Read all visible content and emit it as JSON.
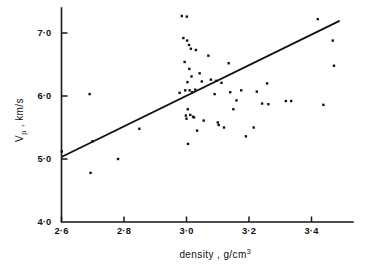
{
  "chart_data": {
    "type": "scatter",
    "title": "",
    "xlabel": "density , g/cm3",
    "ylabel": "Vp , km/s",
    "xlabel_main": "density ,  g/cm",
    "xlabel_exponent": "3",
    "ylabel_main": "V",
    "ylabel_sub": "p",
    "ylabel_rest": " ,  km/s",
    "xlim": [
      2.6,
      3.52
    ],
    "ylim": [
      4.0,
      7.35
    ],
    "grid": false,
    "legend": null,
    "xticks": [
      2.6,
      2.8,
      3.0,
      3.2,
      3.4
    ],
    "xtick_labels": [
      "2·6",
      "2·8",
      "3·0",
      "3·2",
      "3·4"
    ],
    "yticks": [
      4.0,
      5.0,
      6.0,
      7.0
    ],
    "ytick_labels": [
      "4·0",
      "5·0",
      "6·0",
      "7·0"
    ],
    "marker": "square",
    "marker_size_px": 2.4,
    "marker_color": "#111111",
    "line_color": "#121212",
    "axis_color": "#161616",
    "fit_line": {
      "name": "regression line",
      "x": [
        2.603,
        3.488
      ],
      "y": [
        5.04,
        7.19
      ]
    },
    "series": [
      {
        "name": "Vp vs density",
        "points": [
          [
            2.601,
            5.12
          ],
          [
            2.69,
            6.03
          ],
          [
            2.693,
            4.78
          ],
          [
            2.699,
            5.28
          ],
          [
            2.781,
            5.0
          ],
          [
            2.849,
            5.48
          ],
          [
            2.978,
            6.05
          ],
          [
            2.985,
            7.27
          ],
          [
            2.99,
            6.92
          ],
          [
            2.994,
            6.54
          ],
          [
            2.996,
            6.09
          ],
          [
            2.998,
            5.69
          ],
          [
            3.0,
            5.64
          ],
          [
            3.001,
            7.26
          ],
          [
            3.002,
            6.88
          ],
          [
            3.003,
            6.22
          ],
          [
            3.004,
            5.79
          ],
          [
            3.005,
            5.24
          ],
          [
            3.008,
            6.81
          ],
          [
            3.009,
            6.43
          ],
          [
            3.01,
            6.09
          ],
          [
            3.012,
            5.7
          ],
          [
            3.014,
            6.75
          ],
          [
            3.016,
            6.31
          ],
          [
            3.018,
            6.06
          ],
          [
            3.021,
            5.67
          ],
          [
            3.024,
            5.66
          ],
          [
            3.028,
            6.1
          ],
          [
            3.03,
            6.73
          ],
          [
            3.034,
            5.45
          ],
          [
            3.042,
            6.36
          ],
          [
            3.049,
            6.23
          ],
          [
            3.055,
            5.61
          ],
          [
            3.07,
            6.64
          ],
          [
            3.078,
            6.26
          ],
          [
            3.09,
            6.03
          ],
          [
            3.095,
            6.24
          ],
          [
            3.1,
            5.58
          ],
          [
            3.103,
            5.54
          ],
          [
            3.112,
            6.21
          ],
          [
            3.12,
            5.5
          ],
          [
            3.135,
            6.52
          ],
          [
            3.14,
            6.06
          ],
          [
            3.15,
            5.79
          ],
          [
            3.16,
            5.93
          ],
          [
            3.175,
            6.09
          ],
          [
            3.19,
            5.36
          ],
          [
            3.215,
            5.5
          ],
          [
            3.225,
            6.07
          ],
          [
            3.242,
            5.88
          ],
          [
            3.258,
            6.2
          ],
          [
            3.262,
            5.87
          ],
          [
            3.318,
            5.92
          ],
          [
            3.335,
            5.92
          ],
          [
            3.42,
            7.22
          ],
          [
            3.438,
            5.86
          ],
          [
            3.468,
            6.88
          ],
          [
            3.472,
            6.48
          ]
        ]
      }
    ]
  }
}
